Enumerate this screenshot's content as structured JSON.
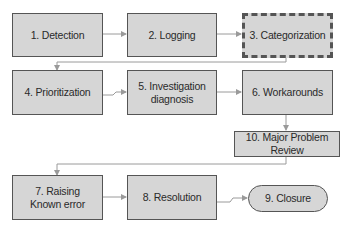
{
  "diagram": {
    "type": "flowchart",
    "nodes": [
      {
        "id": "n1",
        "label": "1. Detection",
        "shape": "rect"
      },
      {
        "id": "n2",
        "label": "2. Logging",
        "shape": "rect"
      },
      {
        "id": "n3",
        "label": "3. Categorization",
        "shape": "rect-dashed"
      },
      {
        "id": "n4",
        "label": "4. Prioritization",
        "shape": "rect"
      },
      {
        "id": "n5",
        "label": "5. Investigation\ndiagnosis",
        "shape": "rect"
      },
      {
        "id": "n6",
        "label": "6. Workarounds",
        "shape": "rect"
      },
      {
        "id": "n10",
        "label": "10. Major Problem Review",
        "shape": "rect"
      },
      {
        "id": "n7",
        "label": "7. Raising\nKnown error",
        "shape": "rect"
      },
      {
        "id": "n8",
        "label": "8. Resolution",
        "shape": "rect"
      },
      {
        "id": "n9",
        "label": "9. Closure",
        "shape": "rounded"
      }
    ],
    "edges": [
      {
        "from": "n1",
        "to": "n2"
      },
      {
        "from": "n2",
        "to": "n3"
      },
      {
        "from": "n3",
        "to": "n4"
      },
      {
        "from": "n4",
        "to": "n5"
      },
      {
        "from": "n5",
        "to": "n6"
      },
      {
        "from": "n6",
        "to": "n10"
      },
      {
        "from": "n10",
        "to": "n7"
      },
      {
        "from": "n7",
        "to": "n8"
      },
      {
        "from": "n8",
        "to": "n9"
      }
    ],
    "colors": {
      "box_fill": "#d6d6d6",
      "box_border": "#555555",
      "connector": "#9a9a9a"
    }
  }
}
